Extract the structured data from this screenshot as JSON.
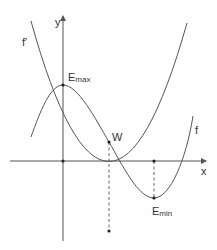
{
  "diagram": {
    "axes": {
      "x_label": "x",
      "y_label": "y"
    },
    "curves": {
      "f": {
        "label": "f",
        "description": "cubic function with local maximum, inflection point and local minimum"
      },
      "f_prime": {
        "label": "f'",
        "description": "derivative parabola"
      }
    },
    "points": {
      "e_max": {
        "label_main": "E",
        "label_sub": "max"
      },
      "w": {
        "label": "W"
      },
      "e_min": {
        "label_main": "E",
        "label_sub": "min"
      }
    },
    "colors": {
      "line": "#555555",
      "text": "#333333",
      "background": "#ffffff"
    }
  }
}
